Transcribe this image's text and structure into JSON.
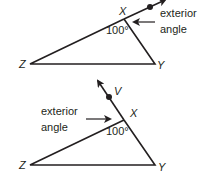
{
  "diagrams": [
    {
      "id": "top",
      "vertices": {
        "X": "X",
        "Y": "Y",
        "Z": "Z"
      },
      "interior_angle": "100°",
      "exterior_label_line1": "exterior",
      "exterior_label_line2": "angle"
    },
    {
      "id": "bottom",
      "vertices": {
        "X": "X",
        "Y": "Y",
        "Z": "Z",
        "V": "V"
      },
      "interior_angle": "100°",
      "exterior_label_line1": "exterior",
      "exterior_label_line2": "angle"
    }
  ],
  "colors": {
    "stroke": "#231f20"
  }
}
